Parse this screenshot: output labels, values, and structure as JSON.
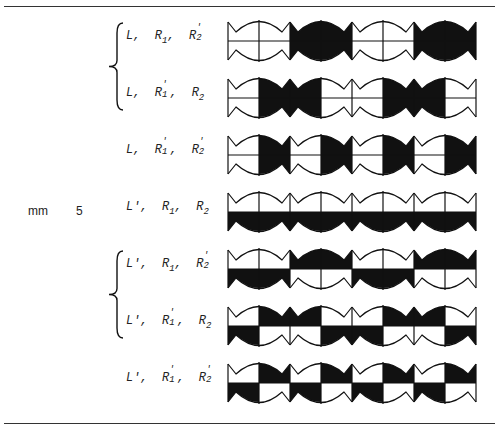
{
  "table": {
    "group_label": "mm",
    "group_number": "5",
    "rows": [
      {
        "parts": [
          {
            "base": "L",
            "prime": false,
            "sub": ""
          },
          {
            "base": "R",
            "prime": false,
            "sub": "1"
          },
          {
            "base": "R",
            "prime": true,
            "sub": "2"
          }
        ],
        "y": 41,
        "pattern": "alt_units"
      },
      {
        "parts": [
          {
            "base": "L",
            "prime": false,
            "sub": ""
          },
          {
            "base": "R",
            "prime": true,
            "sub": "1"
          },
          {
            "base": "R",
            "prime": false,
            "sub": "2"
          }
        ],
        "y": 98,
        "pattern": "alt_halves"
      },
      {
        "parts": [
          {
            "base": "L",
            "prime": false,
            "sub": ""
          },
          {
            "base": "R",
            "prime": true,
            "sub": "1"
          },
          {
            "base": "R",
            "prime": true,
            "sub": "2"
          }
        ],
        "y": 155,
        "pattern": "right_half"
      },
      {
        "parts": [
          {
            "base": "L",
            "prime": true,
            "sub": ""
          },
          {
            "base": "R",
            "prime": false,
            "sub": "1"
          },
          {
            "base": "R",
            "prime": false,
            "sub": "2"
          }
        ],
        "y": 212,
        "pattern": "bottom_half"
      },
      {
        "parts": [
          {
            "base": "L",
            "prime": true,
            "sub": ""
          },
          {
            "base": "R",
            "prime": false,
            "sub": "1"
          },
          {
            "base": "R",
            "prime": true,
            "sub": "2"
          }
        ],
        "y": 269,
        "pattern": "alt_top_bottom"
      },
      {
        "parts": [
          {
            "base": "L",
            "prime": true,
            "sub": ""
          },
          {
            "base": "R",
            "prime": true,
            "sub": "1"
          },
          {
            "base": "R",
            "prime": false,
            "sub": "2"
          }
        ],
        "y": 326,
        "pattern": "alt_checker"
      },
      {
        "parts": [
          {
            "base": "L",
            "prime": true,
            "sub": ""
          },
          {
            "base": "R",
            "prime": true,
            "sub": "1"
          },
          {
            "base": "R",
            "prime": true,
            "sub": "2"
          }
        ],
        "y": 383,
        "pattern": "checker"
      }
    ],
    "braces": [
      {
        "from_row": 0,
        "to_row": 1
      },
      {
        "from_row": 4,
        "to_row": 5
      }
    ],
    "patterns": {
      "alt_units": [
        [
          0,
          0,
          0,
          0
        ],
        [
          1,
          1,
          1,
          1
        ],
        [
          0,
          0,
          0,
          0
        ],
        [
          1,
          1,
          1,
          1
        ]
      ],
      "alt_halves": [
        [
          0,
          1,
          0,
          1
        ],
        [
          1,
          0,
          1,
          0
        ],
        [
          0,
          1,
          0,
          1
        ],
        [
          1,
          0,
          1,
          0
        ]
      ],
      "right_half": [
        [
          0,
          1,
          0,
          1
        ],
        [
          0,
          1,
          0,
          1
        ],
        [
          0,
          1,
          0,
          1
        ],
        [
          0,
          1,
          0,
          1
        ]
      ],
      "bottom_half": [
        [
          0,
          0,
          1,
          1
        ],
        [
          0,
          0,
          1,
          1
        ],
        [
          0,
          0,
          1,
          1
        ],
        [
          0,
          0,
          1,
          1
        ]
      ],
      "alt_top_bottom": [
        [
          0,
          0,
          1,
          1
        ],
        [
          1,
          1,
          0,
          0
        ],
        [
          0,
          0,
          1,
          1
        ],
        [
          1,
          1,
          0,
          0
        ]
      ],
      "alt_checker": [
        [
          0,
          1,
          1,
          0
        ],
        [
          1,
          0,
          0,
          1
        ],
        [
          0,
          1,
          1,
          0
        ],
        [
          1,
          0,
          0,
          1
        ]
      ],
      "checker": [
        [
          0,
          1,
          1,
          0
        ],
        [
          0,
          1,
          1,
          0
        ],
        [
          0,
          1,
          1,
          0
        ],
        [
          0,
          1,
          1,
          0
        ]
      ]
    },
    "colors": {
      "ink": "#111111",
      "paper": "#ffffff"
    }
  }
}
